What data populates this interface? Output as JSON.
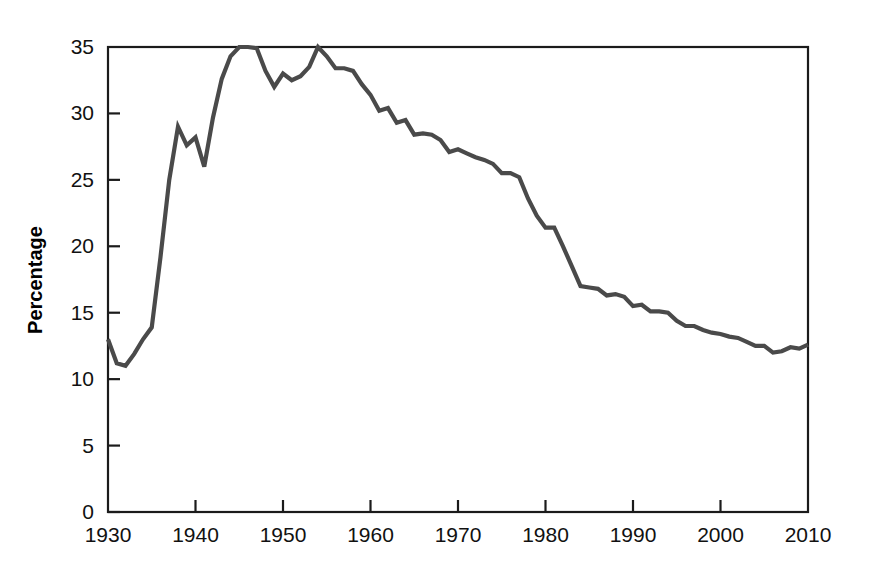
{
  "chart_data": {
    "type": "line",
    "title": "",
    "subtitle": "",
    "xlabel": "",
    "ylabel": "Percentage",
    "xlim": [
      1930,
      2010
    ],
    "ylim": [
      0,
      35
    ],
    "xticks": [
      1930,
      1940,
      1950,
      1960,
      1970,
      1980,
      1990,
      2000,
      2010
    ],
    "xticklabels": [
      "1930",
      "1940",
      "1950",
      "1960",
      "1970",
      "1980",
      "1990",
      "2000",
      "2010"
    ],
    "yticks": [
      0,
      5,
      10,
      15,
      20,
      25,
      30,
      35
    ],
    "yticklabels": [
      "0",
      "5",
      "10",
      "15",
      "20",
      "25",
      "30",
      "35"
    ],
    "grid": false,
    "legend": false,
    "legend_position": "none",
    "line_color": "#4a4a4a",
    "line_width": 4.2,
    "axis_color": "#1b1b1b",
    "background_color": "#ffffff",
    "series": [
      {
        "name": "Percentage",
        "color": "#4a4a4a",
        "x": [
          1930,
          1931,
          1932,
          1933,
          1934,
          1935,
          1936,
          1937,
          1938,
          1939,
          1940,
          1941,
          1942,
          1943,
          1944,
          1945,
          1946,
          1947,
          1948,
          1949,
          1950,
          1951,
          1952,
          1953,
          1954,
          1955,
          1956,
          1957,
          1958,
          1959,
          1960,
          1961,
          1962,
          1963,
          1964,
          1965,
          1966,
          1967,
          1968,
          1969,
          1970,
          1971,
          1972,
          1973,
          1974,
          1975,
          1976,
          1977,
          1978,
          1979,
          1980,
          1981,
          1982,
          1983,
          1984,
          1985,
          1986,
          1987,
          1988,
          1989,
          1990,
          1991,
          1992,
          1993,
          1994,
          1995,
          1996,
          1997,
          1998,
          1999,
          2000,
          2001,
          2002,
          2003,
          2004,
          2005,
          2006,
          2007,
          2008,
          2009,
          2010
        ],
        "values": [
          13.0,
          11.2,
          11.0,
          11.9,
          13.0,
          13.9,
          19.2,
          25.0,
          29.0,
          27.6,
          28.2,
          26.0,
          29.7,
          32.6,
          34.3,
          35.0,
          35.0,
          34.9,
          33.2,
          32.0,
          33.0,
          32.5,
          32.8,
          33.5,
          35.0,
          34.3,
          33.4,
          33.4,
          33.2,
          32.2,
          31.4,
          30.2,
          30.4,
          29.3,
          29.5,
          28.4,
          28.5,
          28.4,
          28.0,
          27.1,
          27.3,
          27.0,
          26.7,
          26.5,
          26.2,
          25.5,
          25.5,
          25.2,
          23.6,
          22.3,
          21.4,
          21.4,
          20.0,
          18.5,
          17.0,
          16.9,
          16.8,
          16.3,
          16.4,
          16.2,
          15.5,
          15.6,
          15.1,
          15.1,
          15.0,
          14.4,
          14.0,
          14.0,
          13.7,
          13.5,
          13.4,
          13.2,
          13.1,
          12.8,
          12.5,
          12.5,
          12.0,
          12.1,
          12.4,
          12.3,
          12.6
        ]
      }
    ]
  }
}
